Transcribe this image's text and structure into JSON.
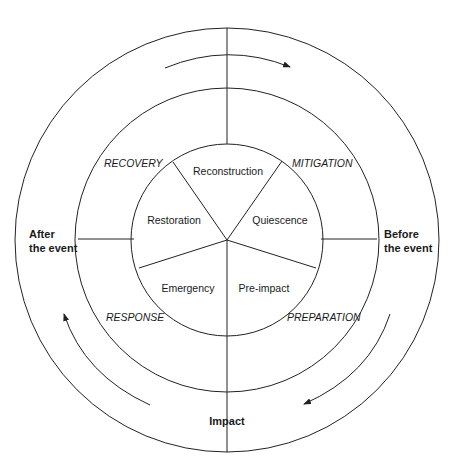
{
  "diagram": {
    "type": "disaster-management-cycle",
    "center": {
      "x": 227,
      "y": 240
    },
    "rings": {
      "outer_r": 212,
      "middle_r": 152,
      "inner_r": 96
    },
    "time_labels": {
      "after_line1": "After",
      "after_line2": "the event",
      "before_line1": "Before",
      "before_line2": "the event",
      "impact": "Impact"
    },
    "phases": [
      {
        "label": "RECOVERY"
      },
      {
        "label": "MITIGATION"
      },
      {
        "label": "PREPARATION"
      },
      {
        "label": "RESPONSE"
      }
    ],
    "stages": [
      {
        "label": "Reconstruction"
      },
      {
        "label": "Quiescence"
      },
      {
        "label": "Pre-impact"
      },
      {
        "label": "Emergency"
      },
      {
        "label": "Restoration"
      }
    ],
    "arrows": [
      {
        "name": "top-arrow",
        "direction": "clockwise"
      },
      {
        "name": "right-arrow",
        "direction": "clockwise"
      },
      {
        "name": "left-arrow",
        "direction": "clockwise"
      }
    ],
    "colors": {
      "line": "#222222",
      "text": "#1a1a1a",
      "background": "#ffffff"
    }
  }
}
